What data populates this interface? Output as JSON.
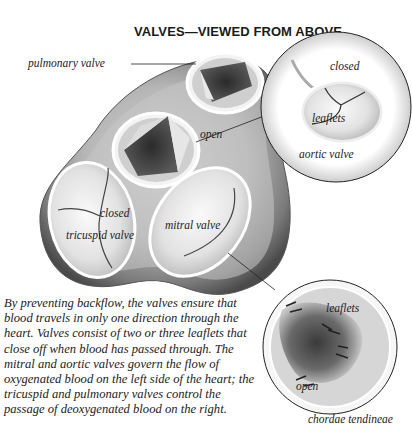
{
  "figure": {
    "title": "VALVES—VIEWED FROM ABOVE",
    "labels": {
      "pulmonary_valve": "pulmonary valve",
      "open_top": "open",
      "closed_aortic": "closed",
      "leaflets_aortic": "leaflets",
      "aortic_valve": "aortic valve",
      "closed_tricuspid": "closed",
      "tricuspid_valve": "tricuspid valve",
      "mitral_valve": "mitral valve",
      "leaflets_mitral": "leaflets",
      "open_mitral": "open",
      "chordae_tendineae": "chordae tendineae"
    }
  },
  "caption": {
    "lines": [
      "By preventing backflow, the valves ensure that",
      "blood travels in only one direction through the",
      "heart. Valves consist of two or three leaflets that",
      "close off when blood has passed through. The",
      "mitral and aortic valves govern the flow of",
      "oxygenated blood on the left side of the heart; the",
      "tricuspid and pulmonary valves control the",
      "passage of deoxygenated blood on the right."
    ]
  }
}
